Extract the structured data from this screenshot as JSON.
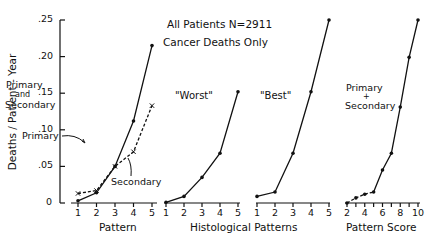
{
  "figure": {
    "title_line1": "All Patients  N=2911",
    "title_line2": "Cancer Deaths Only",
    "ylabel": "Deaths / Patient - Year",
    "yticks": [
      ".25",
      ".20",
      ".15",
      ".10",
      ".05",
      "0"
    ],
    "group_xlabel": "Histological  Patterns",
    "colors": {
      "ink": "#111111",
      "background": "#ffffff"
    }
  },
  "chart_data": [
    {
      "type": "line",
      "panel_label": "Primary and Secondary",
      "xlabel": "Pattern",
      "ylabel": "Deaths/Patient-Year",
      "x": [
        1,
        2,
        3,
        4,
        5
      ],
      "xticks": [
        "1",
        "2",
        "3",
        "4",
        "5"
      ],
      "ylim": [
        0,
        0.25
      ],
      "series": [
        {
          "name": "Primary",
          "style": "solid",
          "marker": "dot",
          "values": [
            0.003,
            0.014,
            0.05,
            0.112,
            0.215
          ]
        },
        {
          "name": "Secondary",
          "style": "dashed",
          "marker": "x",
          "values": [
            0.013,
            0.017,
            0.05,
            0.07,
            0.133
          ]
        }
      ],
      "annotations": [
        "Primary and Secondary",
        "Primary",
        "Secondary"
      ]
    },
    {
      "type": "line",
      "panel_label": "\"Worst\"",
      "xlabel": "Histological Patterns",
      "x": [
        1,
        2,
        3,
        4,
        5
      ],
      "xticks": [
        "1",
        "2",
        "3",
        "4",
        "5"
      ],
      "ylim": [
        0,
        0.25
      ],
      "series": [
        {
          "name": "Worst",
          "style": "solid",
          "marker": "dot",
          "values": [
            0.001,
            0.009,
            0.035,
            0.068,
            0.152
          ]
        }
      ]
    },
    {
      "type": "line",
      "panel_label": "\"Best\"",
      "xlabel": "Histological Patterns",
      "x": [
        1,
        2,
        3,
        4,
        5
      ],
      "xticks": [
        "1",
        "2",
        "3",
        "4",
        "5"
      ],
      "ylim": [
        0,
        0.25
      ],
      "series": [
        {
          "name": "Best",
          "style": "solid",
          "marker": "dot",
          "values": [
            0.009,
            0.015,
            0.068,
            0.152,
            0.25
          ]
        }
      ]
    },
    {
      "type": "line",
      "panel_label": "Primary + Secondary",
      "xlabel": "Pattern Score",
      "x": [
        2,
        3,
        4,
        5,
        6,
        7,
        8,
        9,
        10
      ],
      "xticks": [
        "2",
        "4",
        "6",
        "8",
        "10"
      ],
      "ylim": [
        0,
        0.25
      ],
      "series": [
        {
          "name": "Primary + Secondary",
          "style": "solid (dashed for 2–5)",
          "marker": "dot",
          "values": [
            0.0,
            0.007,
            0.012,
            0.015,
            0.045,
            0.068,
            0.131,
            0.199,
            0.25
          ]
        }
      ]
    }
  ]
}
